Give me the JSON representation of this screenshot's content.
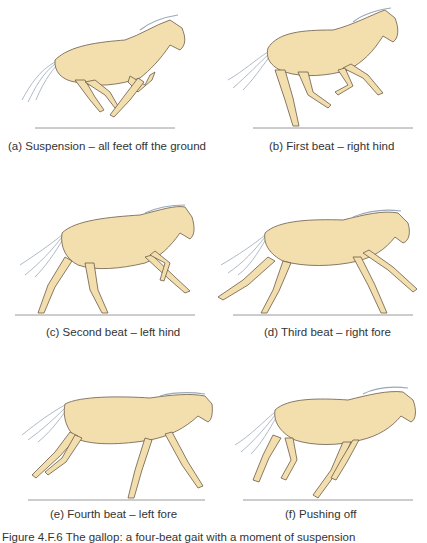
{
  "figure": {
    "colors": {
      "coat": "#f3dfae",
      "coat_shade": "#e2c283",
      "outline": "#6b5a48",
      "mane": "#9aa8b8",
      "hoof": "#8a6a78",
      "ground": "#9a9a9a"
    },
    "panels": [
      {
        "id": "a",
        "caption": "(a) Suspension – all feet off the ground"
      },
      {
        "id": "b",
        "caption": "(b) First beat – right hind"
      },
      {
        "id": "c",
        "caption": "(c) Second beat – left hind"
      },
      {
        "id": "d",
        "caption": "(d) Third beat – right fore"
      },
      {
        "id": "e",
        "caption": "(e) Fourth beat – left fore"
      },
      {
        "id": "f",
        "caption": "(f) Pushing off"
      }
    ],
    "caption_partial": "Figure 4.F.6 The gallop: a four-beat gait with a moment of suspension"
  }
}
